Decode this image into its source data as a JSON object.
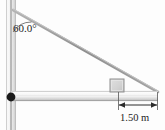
{
  "figure": {
    "type": "physics-free-body-diagram",
    "background_color": "#fdfdfd"
  },
  "labels": {
    "angle": "60.0°",
    "length": "1.50 m"
  },
  "colors": {
    "pole_light": "#f2f2f2",
    "pole_mid": "#d8d8d8",
    "pole_edge": "#9a9a9a",
    "beam_light": "#fbfbfb",
    "beam_mid": "#e2e2e2",
    "beam_shadow": "#a8a8a8",
    "cable": "#9b9b9b",
    "block_fill": "#d4d4d4",
    "block_border": "#8e8e8e",
    "pivot": "#1a1a1a",
    "dimension": "#2b2b2b",
    "text": "#1d1d1d"
  },
  "elements": {
    "wall_pole": {
      "name": "vertical-wall-pole",
      "x": 6,
      "y_top": 0,
      "y_bottom": 130,
      "width": 10
    },
    "pivot_point": {
      "name": "hinge-pivot",
      "x": 11,
      "y": 97,
      "radius": 4.2
    },
    "beam": {
      "name": "horizontal-beam",
      "x_left": 11,
      "x_right": 158,
      "y_top": 91,
      "height": 10
    },
    "cable": {
      "name": "support-cable",
      "x_start": 13,
      "y_start": 10,
      "x_end": 158,
      "y_end": 92
    },
    "angle_arc": {
      "name": "angle-arc",
      "center_x": 13,
      "center_y": 10,
      "radius": 22,
      "value": "60.0°"
    },
    "block": {
      "name": "block-on-beam",
      "x": 110,
      "y": 79,
      "width": 14,
      "height": 13
    },
    "dimension": {
      "name": "dimension-1-50-m",
      "x_left": 118,
      "x_right": 158,
      "y": 105,
      "extension_top": 92
    }
  }
}
